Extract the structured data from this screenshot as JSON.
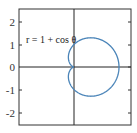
{
  "chart_data": {
    "type": "line",
    "title": "",
    "annotation": "r = 1 + cos θ",
    "equation": "r = 1 + cos θ",
    "curve": "cardioid (polar)",
    "xlabel": "",
    "ylabel": "",
    "xlim": [
      -2.4,
      2.5
    ],
    "ylim": [
      -2.5,
      2.5
    ],
    "yticks": [
      "2",
      "1",
      "0",
      "-1",
      "-2"
    ],
    "ytick_values": [
      2,
      1,
      0,
      -1,
      -2
    ],
    "grid": false,
    "series": [
      {
        "name": "r = 1 + cos θ",
        "color": "#4a84b8",
        "points_polar": "theta 0..2π, r = 1 + cos θ",
        "key_points": [
          {
            "x": 2,
            "y": 0
          },
          {
            "x": 0,
            "y": 0
          },
          {
            "x": 0.5,
            "y": 1.3
          },
          {
            "x": 0.5,
            "y": -1.3
          },
          {
            "x": 0,
            "y": 1
          },
          {
            "x": 0,
            "y": -1
          }
        ]
      }
    ]
  },
  "colors": {
    "curve": "#4a84b8",
    "axes": "#222222"
  }
}
